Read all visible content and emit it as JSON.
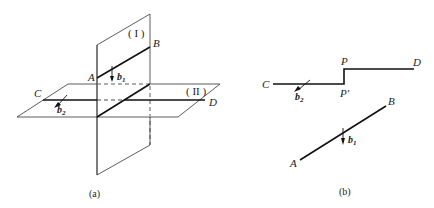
{
  "figure_a": {
    "caption": "(a)",
    "plane_1_label": "( I )",
    "plane_2_label": "( II )",
    "point_a": "A",
    "point_b": "B",
    "point_c": "C",
    "point_d": "D",
    "vector_b1": "b",
    "vector_b1_sub": "1",
    "vector_b2": "b",
    "vector_b2_sub": "2"
  },
  "figure_b": {
    "caption": "(b)",
    "point_c": "C",
    "point_d": "D",
    "point_p": "P",
    "point_p_prime": "P′",
    "point_a": "A",
    "point_b": "B",
    "vector_b1": "b",
    "vector_b1_sub": "1",
    "vector_b2": "b",
    "vector_b2_sub": "2"
  },
  "colors": {
    "line": "#222222",
    "thin": "#333333"
  }
}
